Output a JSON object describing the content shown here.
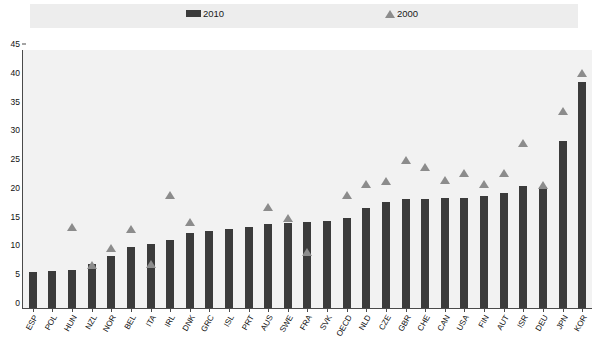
{
  "legend": {
    "entries": [
      {
        "label": "2010",
        "marker": "bar-swatch",
        "color": "#3b3b3b"
      },
      {
        "label": "2000",
        "marker": "triangle-swatch",
        "color": "#8c8c8c"
      }
    ]
  },
  "chart_data": {
    "type": "bar",
    "title": "",
    "subtitle": "",
    "xlabel": "",
    "ylabel": "",
    "ylim": [
      0,
      45
    ],
    "yticks": [
      0,
      5,
      10,
      15,
      20,
      25,
      30,
      35,
      40,
      45
    ],
    "grid": false,
    "legend_position": "top",
    "categories": [
      "ESP",
      "POL",
      "HUN",
      "NZL",
      "NOR",
      "BEL",
      "ITA",
      "IRL",
      "DNK",
      "GRC",
      "ISL",
      "PRT",
      "AUS",
      "SWE",
      "FRA",
      "SVK",
      "OECD",
      "NLD",
      "CZE",
      "GBR",
      "CHE",
      "CAN",
      "USA",
      "FIN",
      "AUT",
      "ISR",
      "DEU",
      "JPN",
      "KOR"
    ],
    "series": [
      {
        "name": "2010",
        "type": "bar",
        "color": "#3b3b3b",
        "values": [
          6.2,
          6.4,
          6.6,
          7.6,
          9.1,
          10.6,
          11.1,
          11.9,
          13.0,
          13.4,
          13.7,
          14.0,
          14.6,
          14.7,
          15.0,
          15.2,
          15.6,
          17.3,
          18.4,
          18.9,
          19.0,
          19.2,
          19.2,
          19.4,
          20.0,
          21.2,
          21.1,
          29.0,
          39.3
        ]
      },
      {
        "name": "2000",
        "type": "scatter",
        "color": "#8c8c8c",
        "values": [
          null,
          null,
          14.0,
          7.5,
          10.5,
          13.7,
          7.6,
          19.7,
          15.0,
          null,
          null,
          null,
          17.6,
          15.6,
          9.8,
          null,
          19.7,
          21.6,
          22.0,
          25.7,
          24.5,
          22.3,
          23.5,
          21.6,
          23.4,
          28.6,
          21.3,
          34.2,
          40.8
        ]
      }
    ]
  }
}
